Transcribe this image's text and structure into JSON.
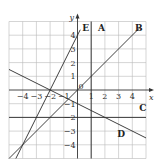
{
  "chart_data": {
    "type": "line",
    "title": "",
    "xlabel": "x",
    "ylabel": "y",
    "xlim": [
      -5,
      5
    ],
    "ylim": [
      -5,
      5
    ],
    "grid": true,
    "x_ticks": [
      -4,
      -3,
      -2,
      -1,
      1,
      2,
      3,
      4
    ],
    "x_tick_labels": [
      "−4",
      "−3",
      "−2",
      "−1",
      "1",
      "2",
      "3",
      "4"
    ],
    "y_ticks": [
      4,
      3,
      2,
      1,
      -1,
      -2,
      -3,
      -4
    ],
    "y_tick_labels": [
      "4",
      "3",
      "2",
      "1",
      "−1",
      "−2",
      "−3",
      "−4"
    ],
    "origin_label": "0",
    "series": [
      {
        "name": "A",
        "equation": "x = 1",
        "points": [
          [
            1,
            -5
          ],
          [
            1,
            5
          ]
        ],
        "label_at": [
          1.5,
          4.3
        ]
      },
      {
        "name": "B",
        "equation": "y = x",
        "points": [
          [
            -5,
            -5
          ],
          [
            4.6,
            4.6
          ]
        ],
        "label_at": [
          4.2,
          4.3
        ]
      },
      {
        "name": "C",
        "equation": "y = -2",
        "points": [
          [
            -5,
            -2
          ],
          [
            5,
            -2
          ]
        ],
        "label_at": [
          4.5,
          -1.5
        ]
      },
      {
        "name": "D",
        "equation": "y = -x/2 - 1",
        "points": [
          [
            -5,
            1.5
          ],
          [
            5,
            -3.5
          ]
        ],
        "label_at": [
          2.9,
          -3.4
        ]
      },
      {
        "name": "E",
        "equation": "y = 2x + 4",
        "points": [
          [
            -4.5,
            -5
          ],
          [
            0.2,
            4.4
          ]
        ],
        "label_at": [
          0.35,
          4.3
        ]
      }
    ]
  }
}
